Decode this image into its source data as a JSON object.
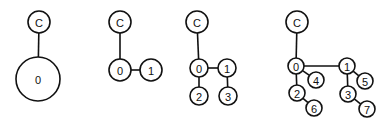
{
  "diagrams": [
    {
      "id": "stage-1",
      "nodes": [
        {
          "id": "C",
          "label": "C",
          "x": 39,
          "y": 22,
          "r": 11
        },
        {
          "id": "0",
          "label": "0",
          "x": 38,
          "y": 79,
          "r": 22
        }
      ],
      "edges": [
        [
          "C",
          "0"
        ]
      ]
    },
    {
      "id": "stage-2",
      "nodes": [
        {
          "id": "C",
          "label": "C",
          "x": 120,
          "y": 22,
          "r": 11
        },
        {
          "id": "0",
          "label": "0",
          "x": 120,
          "y": 70,
          "r": 11
        },
        {
          "id": "1",
          "label": "1",
          "x": 151,
          "y": 70,
          "r": 11
        }
      ],
      "edges": [
        [
          "C",
          "0"
        ],
        [
          "0",
          "1"
        ]
      ]
    },
    {
      "id": "stage-3",
      "nodes": [
        {
          "id": "C",
          "label": "C",
          "x": 197,
          "y": 22,
          "r": 11
        },
        {
          "id": "0",
          "label": "0",
          "x": 199,
          "y": 68,
          "r": 9
        },
        {
          "id": "1",
          "label": "1",
          "x": 227,
          "y": 68,
          "r": 9
        },
        {
          "id": "2",
          "label": "2",
          "x": 199,
          "y": 96,
          "r": 9
        },
        {
          "id": "3",
          "label": "3",
          "x": 228,
          "y": 96,
          "r": 9
        }
      ],
      "edges": [
        [
          "C",
          "0"
        ],
        [
          "0",
          "1"
        ],
        [
          "0",
          "2"
        ],
        [
          "1",
          "3"
        ]
      ]
    },
    {
      "id": "stage-4",
      "nodes": [
        {
          "id": "C",
          "label": "C",
          "x": 297,
          "y": 22,
          "r": 11
        },
        {
          "id": "0",
          "label": "0",
          "x": 296,
          "y": 66,
          "r": 8
        },
        {
          "id": "1",
          "label": "1",
          "x": 347,
          "y": 66,
          "r": 8
        },
        {
          "id": "4",
          "label": "4",
          "x": 316,
          "y": 80,
          "r": 8
        },
        {
          "id": "5",
          "label": "5",
          "x": 365,
          "y": 81,
          "r": 8
        },
        {
          "id": "2",
          "label": "2",
          "x": 297,
          "y": 93,
          "r": 8
        },
        {
          "id": "3",
          "label": "3",
          "x": 348,
          "y": 94,
          "r": 8
        },
        {
          "id": "6",
          "label": "6",
          "x": 314,
          "y": 108,
          "r": 8
        },
        {
          "id": "7",
          "label": "7",
          "x": 367,
          "y": 109,
          "r": 8
        }
      ],
      "edges": [
        [
          "C",
          "0"
        ],
        [
          "0",
          "1"
        ],
        [
          "0",
          "4"
        ],
        [
          "0",
          "2"
        ],
        [
          "2",
          "6"
        ],
        [
          "1",
          "5"
        ],
        [
          "1",
          "3"
        ],
        [
          "3",
          "7"
        ]
      ]
    }
  ]
}
